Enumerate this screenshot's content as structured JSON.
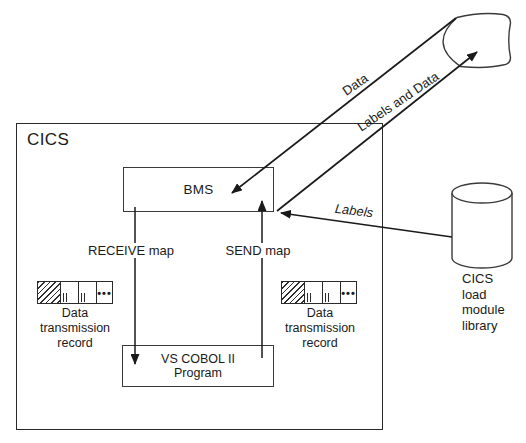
{
  "diagram": {
    "title_context": "CICS BMS mapping diagram",
    "cics_label": "CICS",
    "bms_label": "BMS",
    "program_label": "VS COBOL II\nProgram",
    "receive_label": "RECEIVE map",
    "send_label": "SEND map",
    "record_label": "Data transmission\nrecord",
    "record_dots": "•••",
    "library_label": "CICS\nload\nmodule\nlibrary",
    "arrows": {
      "data": "Data",
      "labels_and_data": "Labels and Data",
      "labels": "Labels"
    },
    "colors": {
      "ink": "#1a1a1a",
      "box_border": "#2a2a2a",
      "background": "#ffffff"
    }
  }
}
